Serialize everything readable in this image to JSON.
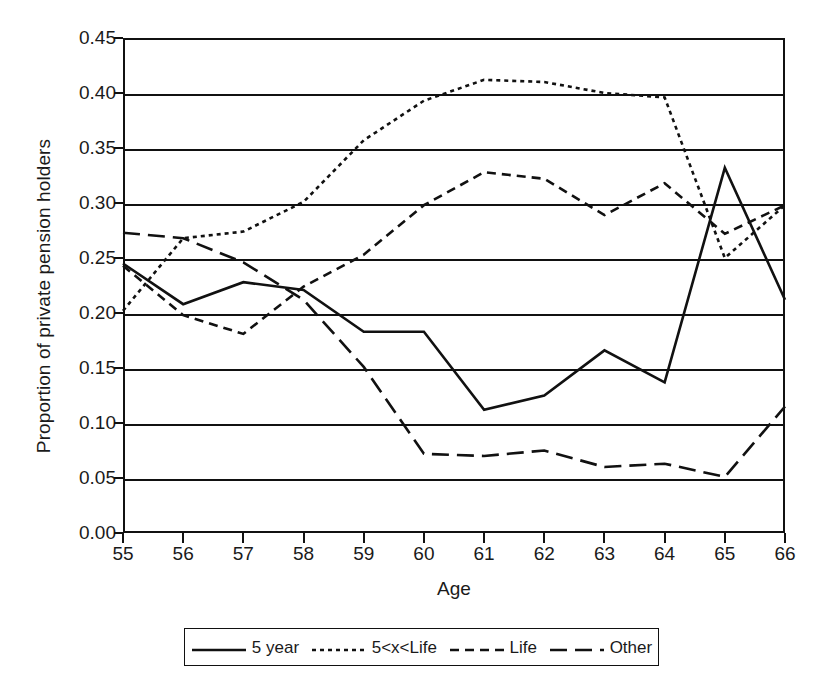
{
  "chart_data": {
    "type": "line",
    "title": "",
    "xlabel": "Age",
    "ylabel": "Proportion of private pension holders",
    "x": [
      55,
      56,
      57,
      58,
      59,
      60,
      61,
      62,
      63,
      64,
      65,
      66
    ],
    "categories": [
      "55",
      "56",
      "57",
      "58",
      "59",
      "60",
      "61",
      "62",
      "63",
      "64",
      "65",
      "66"
    ],
    "xlim": [
      55,
      66
    ],
    "ylim": [
      0.0,
      0.45
    ],
    "ytick_labels": [
      "0.00",
      "0.05",
      "0.10",
      "0.15",
      "0.20",
      "0.25",
      "0.30",
      "0.35",
      "0.40",
      "0.45"
    ],
    "ytick_values": [
      0.0,
      0.05,
      0.1,
      0.15,
      0.2,
      0.25,
      0.3,
      0.35,
      0.4,
      0.45
    ],
    "grid": "horizontal",
    "legend_position": "bottom",
    "series": [
      {
        "name": "5 year",
        "style": "solid",
        "values": [
          0.245,
          0.208,
          0.228,
          0.221,
          0.183,
          0.183,
          0.112,
          0.125,
          0.166,
          0.137,
          0.332,
          0.212
        ]
      },
      {
        "name": "5<x<Life",
        "style": "dotted",
        "values": [
          0.202,
          0.268,
          0.274,
          0.301,
          0.357,
          0.393,
          0.412,
          0.41,
          0.4,
          0.396,
          0.25,
          0.298
        ]
      },
      {
        "name": "Life",
        "style": "dashed",
        "values": [
          0.243,
          0.198,
          0.181,
          0.224,
          0.253,
          0.298,
          0.328,
          0.322,
          0.289,
          0.318,
          0.272,
          0.298
        ]
      },
      {
        "name": "Other",
        "style": "long-dash",
        "values": [
          0.273,
          0.268,
          0.246,
          0.212,
          0.151,
          0.072,
          0.07,
          0.075,
          0.06,
          0.063,
          0.051,
          0.115
        ]
      }
    ]
  },
  "axes": {
    "y_title": "Proportion of private pension holders",
    "x_title": "Age"
  },
  "colors": {
    "line": "#111111",
    "grid": "#111111",
    "frame": "#111111",
    "background": "#ffffff"
  }
}
